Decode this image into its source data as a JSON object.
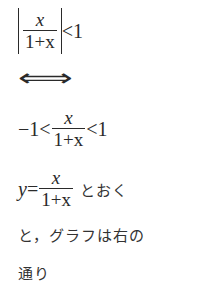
{
  "lines": {
    "l1": {
      "numerator": "x",
      "denominator": "1+x",
      "relation": "<1"
    },
    "l2": {
      "equivalence": "⟺"
    },
    "l3": {
      "left": "−1<",
      "numerator": "x",
      "denominator": "1+x",
      "right": "<1"
    },
    "l4": {
      "var": "y",
      "equals": "=",
      "numerator": "x",
      "denominator": "1+x",
      "text": "とおく"
    },
    "l5": {
      "text": "と，グラフは右の"
    },
    "l6": {
      "text": "通り"
    }
  }
}
